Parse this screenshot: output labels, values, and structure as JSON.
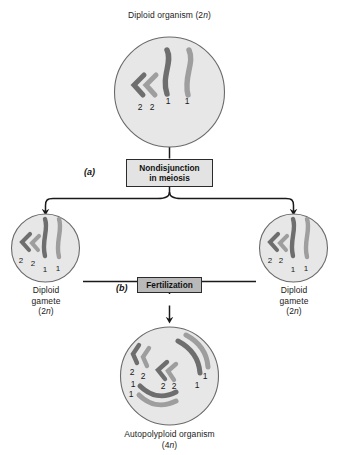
{
  "diagram": {
    "title_top": "Diploid organism (2n)",
    "colors": {
      "cell_fill": "#e7e7e7",
      "cell_stroke": "#6a6a6a",
      "chromosome_dark": "#6e6e6e",
      "chromosome_light": "#9e9e9e",
      "line": "#1a1a1a",
      "box_nondisjunction_fill": "#e3e3e3",
      "box_fertilization_fill": "#b9b9b9",
      "box_border": "#2b2b2b"
    },
    "cells": {
      "parent": {
        "caption": "Diploid organism (2n)",
        "caption_main": "Diploid organism (2",
        "caption_italic": "n",
        "caption_tail": ")",
        "ploidy": "2n",
        "chromosome_counts": {
          "long_1": 2,
          "short_2": 2
        },
        "chromosome_labels": [
          "2",
          "2",
          "1",
          "1"
        ]
      },
      "gamete_left": {
        "caption_line1": "Diploid",
        "caption_line2": "gamete",
        "caption_line3_pre": "(2",
        "caption_line3_italic": "n",
        "caption_line3_post": ")",
        "ploidy": "2n",
        "chromosome_counts": {
          "long_1": 2,
          "short_2": 2
        },
        "chromosome_labels": [
          "2",
          "2",
          "1",
          "1"
        ]
      },
      "gamete_right": {
        "caption_line1": "Diploid",
        "caption_line2": "gamete",
        "caption_line3_pre": "(2",
        "caption_line3_italic": "n",
        "caption_line3_post": ")",
        "ploidy": "2n",
        "chromosome_counts": {
          "long_1": 2,
          "short_2": 2
        },
        "chromosome_labels": [
          "2",
          "2",
          "1",
          "1"
        ]
      },
      "zygote": {
        "caption_line1": "Autopolyploid organism",
        "caption_line2_pre": "(4",
        "caption_line2_italic": "n",
        "caption_line2_post": ")",
        "ploidy": "4n",
        "chromosome_counts": {
          "long_1": 4,
          "short_2": 4
        },
        "chromosome_labels": [
          "2",
          "2",
          "2",
          "2",
          "1",
          "1",
          "1",
          "1"
        ]
      }
    },
    "steps": [
      {
        "id": "(a)",
        "label_line1": "Nondisjunction",
        "label_line2": "in meiosis"
      },
      {
        "id": "(b)",
        "label_line1": "Fertilization",
        "label_line2": ""
      }
    ]
  }
}
